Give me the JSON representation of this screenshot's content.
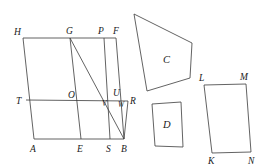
{
  "figure": {
    "stroke_color": "#3b3b3b",
    "label_color": "#1a1a1a",
    "background": "#ffffff"
  },
  "main_shape": {
    "name": "parallelogram-hfba",
    "vertices": {
      "H": {
        "label": "H",
        "x": 23,
        "y": 38
      },
      "G": {
        "label": "G",
        "x": 70,
        "y": 38
      },
      "P": {
        "label": "P",
        "x": 104,
        "y": 38
      },
      "F": {
        "label": "F",
        "x": 116,
        "y": 38
      },
      "T": {
        "label": "T",
        "x": 26,
        "y": 100
      },
      "O": {
        "label": "O",
        "x": 73,
        "y": 100
      },
      "U": {
        "label": "U",
        "x": 116,
        "y": 97
      },
      "V": {
        "label": "V",
        "x": 109,
        "y": 102
      },
      "W": {
        "label": "W",
        "x": 121,
        "y": 102
      },
      "R": {
        "label": "R",
        "x": 128,
        "y": 101
      },
      "A": {
        "label": "A",
        "x": 34,
        "y": 139
      },
      "E": {
        "label": "E",
        "x": 81,
        "y": 139
      },
      "S": {
        "label": "S",
        "x": 110,
        "y": 139
      },
      "B": {
        "label": "B",
        "x": 124,
        "y": 139
      }
    },
    "label_positions": {
      "H": {
        "x": 14,
        "y": 35
      },
      "G": {
        "x": 66,
        "y": 34
      },
      "P": {
        "x": 98,
        "y": 34
      },
      "F": {
        "x": 113,
        "y": 34
      },
      "T": {
        "x": 16,
        "y": 104
      },
      "O": {
        "x": 68,
        "y": 98
      },
      "U": {
        "x": 114,
        "y": 96
      },
      "V": {
        "x": 103,
        "y": 106
      },
      "W": {
        "x": 120,
        "y": 107
      },
      "R": {
        "x": 130,
        "y": 104
      },
      "A": {
        "x": 30,
        "y": 152
      },
      "E": {
        "x": 77,
        "y": 152
      },
      "S": {
        "x": 107,
        "y": 152
      },
      "B": {
        "x": 122,
        "y": 152
      }
    }
  },
  "shape_c": {
    "name": "trapezoid-c",
    "label": "C",
    "label_x": 163,
    "label_y": 63,
    "points": "134,14 192,43 190,78 147,91"
  },
  "shape_d": {
    "name": "quadrilateral-d",
    "label": "D",
    "label_x": 163,
    "label_y": 128,
    "points": "152,104 181,102 183,147 155,146"
  },
  "shape_lmnk": {
    "name": "parallelogram-lmnk",
    "vertices": {
      "L": {
        "label": "L",
        "x": 204,
        "y": 85
      },
      "M": {
        "label": "M",
        "x": 246,
        "y": 84
      },
      "N": {
        "label": "N",
        "x": 251,
        "y": 152
      },
      "K": {
        "label": "K",
        "x": 212,
        "y": 153
      }
    },
    "label_positions": {
      "L": {
        "x": 200,
        "y": 81
      },
      "M": {
        "x": 241,
        "y": 80
      },
      "K": {
        "x": 209,
        "y": 164
      },
      "N": {
        "x": 249,
        "y": 164
      }
    }
  },
  "segments": [
    {
      "name": "top-edge-hf",
      "from": "H",
      "to": "F"
    },
    {
      "name": "bottom-edge-ab",
      "from": "A",
      "to": "B"
    },
    {
      "name": "left-edge-ha",
      "from": "H",
      "to": "A"
    },
    {
      "name": "right-edge-fb",
      "from": "F",
      "to": "B"
    },
    {
      "name": "midline-tr",
      "from": "T",
      "to": "R"
    },
    {
      "name": "cevian-ge",
      "from": "G",
      "to": "E"
    },
    {
      "name": "diagonal-gb",
      "from": "G",
      "to": "B"
    },
    {
      "name": "cevian-ps",
      "from": "P",
      "to": "S"
    },
    {
      "name": "short-edge-rb",
      "from": "R",
      "to": "B"
    }
  ]
}
